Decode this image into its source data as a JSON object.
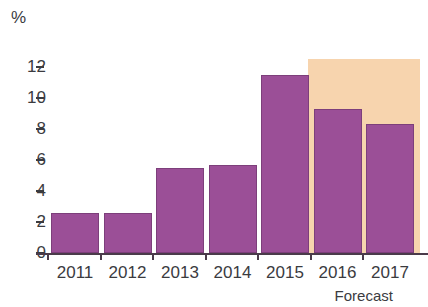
{
  "chart_data": {
    "type": "bar",
    "title": "",
    "subtitle": "",
    "xlabel": "",
    "ylabel": "%",
    "categories": [
      "2011",
      "2012",
      "2013",
      "2014",
      "2015",
      "2016",
      "2017"
    ],
    "values": [
      2.6,
      2.6,
      5.5,
      5.7,
      11.5,
      9.3,
      8.3
    ],
    "series": [
      {
        "name": "",
        "values": [
          2.6,
          2.6,
          5.5,
          5.7,
          11.5,
          9.3,
          8.3
        ]
      }
    ],
    "ylim": [
      0,
      13
    ],
    "y_ticks": [
      0,
      2,
      4,
      6,
      8,
      10,
      12
    ],
    "y_tick_labels": [
      "0",
      "2",
      "4",
      "6",
      "8",
      "10",
      "12"
    ],
    "grid": false,
    "legend": null,
    "annotations": [
      {
        "text": "Forecast",
        "covers_categories": [
          "2016",
          "2017"
        ]
      }
    ],
    "colors": {
      "bar": "#9b4f97",
      "bar_border": "#7d3f7b",
      "forecast_band": "#f7d4ae",
      "axis": "#4a3b4a",
      "text": "#3b3b3f"
    }
  },
  "axis": {
    "unit_label": "%",
    "y_ticks": [
      "12",
      "10",
      "8",
      "6",
      "4",
      "2",
      "0"
    ]
  },
  "x_labels": [
    "2011",
    "2012",
    "2013",
    "2014",
    "2015",
    "2016",
    "2017"
  ],
  "forecast": {
    "label": "Forecast"
  }
}
